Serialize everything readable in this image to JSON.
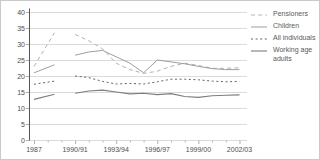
{
  "chart_data": {
    "type": "line",
    "title": "",
    "xlabel": "",
    "ylabel": "",
    "ylim": [
      0,
      40
    ],
    "y_ticks": [
      0,
      5,
      10,
      15,
      20,
      25,
      30,
      35,
      40
    ],
    "grid": "horizontal-only",
    "legend_position": "right",
    "categories": [
      "1987",
      "1988/89",
      "1990/91",
      "1991/92",
      "1992/93",
      "1993/94",
      "1994/95",
      "1995/96",
      "1996/97",
      "1997/98",
      "1998/99",
      "1999/00",
      "2000/01",
      "2001/02",
      "2002/03"
    ],
    "x_offsets": [
      0,
      1.5,
      3,
      4,
      5,
      6,
      7,
      8,
      9,
      10,
      11,
      12,
      13,
      14,
      15
    ],
    "line_break_after_index": 1,
    "x_tick_labels": [
      "1987",
      "1990/91",
      "1993/94",
      "1996/97",
      "1999/00",
      "2002/03"
    ],
    "x_tick_offsets": [
      0,
      3,
      6,
      9,
      12,
      15
    ],
    "x_minor_tick_offsets": [
      1,
      2,
      4,
      5,
      7,
      8,
      10,
      11,
      13,
      14
    ],
    "series": [
      {
        "name": "Pensioners",
        "style": "dashed",
        "color": "#b2b2b2",
        "width": 1,
        "values": [
          23,
          33.5,
          33,
          31,
          28.5,
          24,
          22,
          20.8,
          21.5,
          23,
          24,
          23.3,
          22.4,
          22.4,
          22.6
        ]
      },
      {
        "name": "Children",
        "style": "solid",
        "color": "#9e9e9e",
        "width": 1,
        "values": [
          21,
          23.5,
          26.5,
          27.5,
          28,
          26,
          24,
          21,
          25,
          24.4,
          23.8,
          23,
          22.3,
          22,
          22
        ]
      },
      {
        "name": "All individuals",
        "style": "short-dash",
        "color": "#646464",
        "width": 1,
        "values": [
          17.4,
          18.4,
          20,
          19.5,
          18.3,
          17.5,
          17.7,
          17.5,
          18.2,
          19,
          19,
          18.8,
          18.4,
          18.2,
          18.3
        ]
      },
      {
        "name": "Working age adults",
        "style": "solid",
        "color": "#7d7d7d",
        "width": 1.1,
        "values": [
          12.7,
          14.3,
          14.6,
          15.3,
          15.6,
          15,
          14.4,
          14.6,
          14.2,
          14.5,
          13.6,
          13.3,
          13.8,
          14,
          14.1
        ]
      }
    ],
    "colors": {
      "gridline": "#d2d2d2",
      "axis_line": "#555555",
      "tick": "#9a9a9a",
      "axis_text": "#4d4d4d",
      "legend_text": "#5a5a5a",
      "background": "#ffffff"
    }
  }
}
